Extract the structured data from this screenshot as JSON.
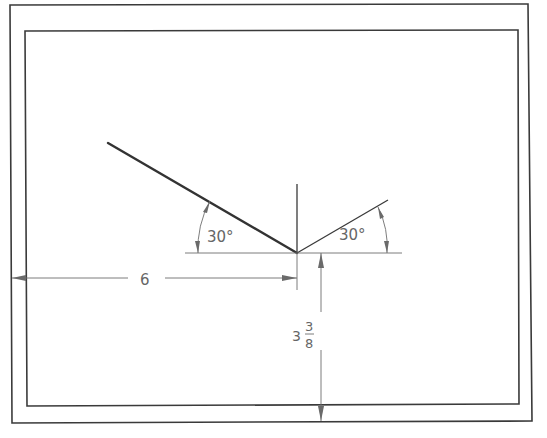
{
  "drawing": {
    "colors": {
      "line": "#333333",
      "dimension": "#6e6e6e",
      "text": "#666666",
      "background": "#ffffff"
    },
    "dimensions": {
      "horizontal": {
        "label": "6"
      },
      "vertical": {
        "whole": "3",
        "numerator": "3",
        "denominator": "8"
      }
    },
    "angles": {
      "left": {
        "label": "30°"
      },
      "right": {
        "label": "30°"
      }
    }
  }
}
